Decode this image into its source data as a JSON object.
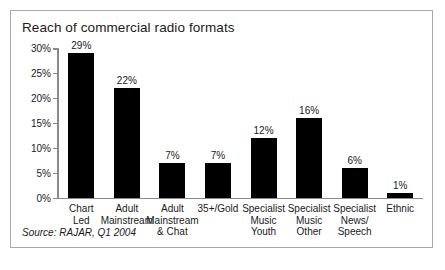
{
  "figure": {
    "title": "Reach of commercial radio formats",
    "source": "Source: RAJAR, Q1 2004",
    "border_color": "#a9a9a9",
    "background_color": "#ffffff"
  },
  "chart_data": {
    "type": "bar",
    "title": "Reach of commercial radio formats",
    "xlabel": "",
    "ylabel": "",
    "ylim": [
      0,
      30
    ],
    "grid": false,
    "legend": null,
    "bar_color": "#000000",
    "axis_color": "#8a8a8a",
    "ytick_labels": [
      "30%",
      "25%",
      "20%",
      "15%",
      "10%",
      "5%",
      "0%"
    ],
    "ytick_values": [
      30,
      25,
      20,
      15,
      10,
      5,
      0
    ],
    "categories": [
      "Chart Led",
      "Adult Mainstream",
      "Adult Mainstream & Chat",
      "35+/Gold",
      "Specialist Music Youth",
      "Specialist Music Other",
      "Specialist News/Speech",
      "Ethnic"
    ],
    "category_lines": [
      [
        "Chart",
        "Led"
      ],
      [
        "Adult",
        "Mainstream"
      ],
      [
        "Adult",
        "Mainstream",
        "& Chat"
      ],
      [
        "35+/Gold"
      ],
      [
        "Specialist",
        "Music",
        "Youth"
      ],
      [
        "Specialist",
        "Music",
        "Other"
      ],
      [
        "Specialist",
        "News/",
        "Speech"
      ],
      [
        "Ethnic"
      ]
    ],
    "values": [
      29,
      22,
      7,
      7,
      12,
      16,
      6,
      1
    ],
    "value_labels": [
      "29%",
      "22%",
      "7%",
      "7%",
      "12%",
      "16%",
      "6%",
      "1%"
    ]
  }
}
